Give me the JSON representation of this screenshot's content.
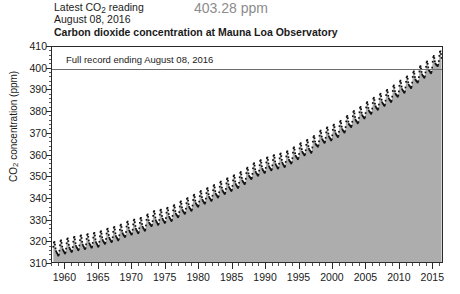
{
  "header": {
    "latest_label_pre": "Latest CO",
    "latest_label_sub": "2",
    "latest_label_post": " reading",
    "latest_date": "August 08, 2016",
    "latest_reading": "403.28 ppm",
    "title": "Carbon dioxide concentration at Mauna Loa Observatory",
    "reading_color": "#8c8c8c"
  },
  "annotation": {
    "record_label": "Full record ending August 08, 2016",
    "record_value": 400,
    "line_color": "#6e6e6e"
  },
  "axes": {
    "y_title_pre": "CO",
    "y_title_sub": "2",
    "y_title_post": " concentration (ppm)",
    "y_ticks": [
      310,
      320,
      330,
      340,
      350,
      360,
      370,
      380,
      390,
      400,
      410
    ],
    "y_minor_step": 2,
    "x_ticks": [
      1960,
      1965,
      1970,
      1975,
      1980,
      1985,
      1990,
      1995,
      2000,
      2005,
      2010,
      2015
    ],
    "x_minor_step": 1
  },
  "chart_data": {
    "type": "area",
    "title": "Carbon dioxide concentration at Mauna Loa Observatory",
    "xlabel": "",
    "ylabel": "CO2 concentration (ppm)",
    "xlim": [
      1958.0,
      2016.6
    ],
    "ylim": [
      310,
      410
    ],
    "grid": false,
    "legend": null,
    "fill_color": "#adadad",
    "marker_color": "#111111",
    "annotations": [
      {
        "text": "Full record ending August 08, 2016",
        "y": 400,
        "type": "hline"
      }
    ],
    "series": [
      {
        "name": "Monthly mean CO2 (ppm)",
        "description": "Keeling curve: monthly mean atmospheric CO2 at Mauna Loa, annual trend with ~6 ppm seasonal sawtooth peaking in May and minimum in September.",
        "annual_mean": {
          "x": [
            1958,
            1959,
            1960,
            1961,
            1962,
            1963,
            1964,
            1965,
            1966,
            1967,
            1968,
            1969,
            1970,
            1971,
            1972,
            1973,
            1974,
            1975,
            1976,
            1977,
            1978,
            1979,
            1980,
            1981,
            1982,
            1983,
            1984,
            1985,
            1986,
            1987,
            1988,
            1989,
            1990,
            1991,
            1992,
            1993,
            1994,
            1995,
            1996,
            1997,
            1998,
            1999,
            2000,
            2001,
            2002,
            2003,
            2004,
            2005,
            2006,
            2007,
            2008,
            2009,
            2010,
            2011,
            2012,
            2013,
            2014,
            2015,
            2016
          ],
          "y": [
            315.3,
            315.9,
            316.9,
            317.6,
            318.4,
            318.9,
            319.6,
            320.0,
            321.4,
            322.2,
            323.0,
            324.6,
            325.7,
            326.3,
            327.5,
            329.7,
            330.2,
            331.1,
            332.0,
            333.8,
            335.4,
            336.8,
            338.7,
            340.1,
            341.4,
            343.0,
            344.6,
            346.0,
            347.4,
            349.2,
            351.6,
            353.1,
            354.4,
            355.6,
            356.4,
            357.1,
            358.8,
            360.8,
            362.6,
            363.7,
            366.7,
            368.4,
            369.5,
            371.1,
            373.2,
            375.8,
            377.5,
            379.8,
            381.9,
            383.8,
            385.6,
            387.4,
            389.9,
            391.7,
            393.9,
            396.5,
            398.7,
            400.8,
            404.2
          ]
        },
        "seasonal_amplitude_ppm": 6.2,
        "seasonal_peak_month": 5,
        "seasonal_min_month": 9,
        "first_value": 315.3,
        "last_value": 403.28,
        "units": "ppm"
      }
    ]
  }
}
